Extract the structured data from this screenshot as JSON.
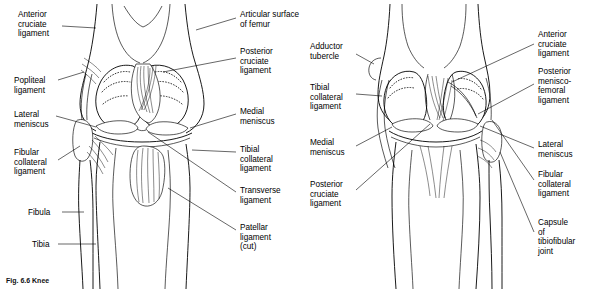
{
  "figure": {
    "caption": "Fig. 6.6  Knee",
    "views": [
      {
        "name": "anterior-view",
        "description": "Anterior view of right knee joint with patella removed"
      },
      {
        "name": "posterior-view",
        "description": "Posterior view of right knee joint"
      }
    ]
  },
  "labels": {
    "left_view": [
      {
        "id": "anterior-cruciate-ligament",
        "text": "Anterior\ncruciate\nligament",
        "x": 18,
        "y": 10,
        "align": "left"
      },
      {
        "id": "popliteal-ligament",
        "text": "Popliteal\nligament",
        "x": 14,
        "y": 76,
        "align": "left"
      },
      {
        "id": "lateral-meniscus",
        "text": "Lateral\nmeniscus",
        "x": 14,
        "y": 110,
        "align": "left"
      },
      {
        "id": "fibular-collateral-ligament",
        "text": "Fibular\ncollateral\nligament",
        "x": 14,
        "y": 148,
        "align": "left"
      },
      {
        "id": "fibula",
        "text": "Fibula",
        "x": 28,
        "y": 208,
        "align": "left"
      },
      {
        "id": "tibia",
        "text": "Tibia",
        "x": 32,
        "y": 240,
        "align": "left"
      },
      {
        "id": "articular-surface-of-femur",
        "text": "Articular surface\nof femur",
        "x": 240,
        "y": 10,
        "align": "left"
      },
      {
        "id": "posterior-cruciate-ligament",
        "text": "Posterior\ncruciate\nligament",
        "x": 240,
        "y": 47,
        "align": "left"
      },
      {
        "id": "medial-meniscus",
        "text": "Medial\nmeniscus",
        "x": 240,
        "y": 107,
        "align": "left"
      },
      {
        "id": "tibial-collateral-ligament",
        "text": "Tibial\ncollateral\nligament",
        "x": 240,
        "y": 145,
        "align": "left"
      },
      {
        "id": "transverse-ligament",
        "text": "Transverse\nligament",
        "x": 240,
        "y": 186,
        "align": "left"
      },
      {
        "id": "patellar-ligament-cut",
        "text": "Patellar\nligament\n(cut)",
        "x": 240,
        "y": 223,
        "align": "left"
      }
    ],
    "right_view": [
      {
        "id": "adductor-tubercle",
        "text": "Adductor\ntubercle",
        "x": 310,
        "y": 42,
        "align": "left"
      },
      {
        "id": "tibial-collateral-ligament-post",
        "text": "Tibial\ncollateral\nligament",
        "x": 310,
        "y": 83,
        "align": "left"
      },
      {
        "id": "medial-meniscus-post",
        "text": "Medial\nmeniscus",
        "x": 310,
        "y": 138,
        "align": "left"
      },
      {
        "id": "posterior-cruciate-ligament-post",
        "text": "Posterior\ncruciate\nligament",
        "x": 310,
        "y": 180,
        "align": "left"
      },
      {
        "id": "anterior-cruciate-ligament-post",
        "text": "Anterior\ncruciate\nligament",
        "x": 538,
        "y": 30,
        "align": "left"
      },
      {
        "id": "posterior-meniscofemoral-ligament",
        "text": "Posterior\nmenisco-\nfemoral\nligament",
        "x": 538,
        "y": 67,
        "align": "left"
      },
      {
        "id": "lateral-meniscus-post",
        "text": "Lateral\nmeniscus",
        "x": 538,
        "y": 140,
        "align": "left"
      },
      {
        "id": "fibular-collateral-ligament-post",
        "text": "Fibular\ncollateral\nligament",
        "x": 538,
        "y": 170,
        "align": "left"
      },
      {
        "id": "capsule-of-tibiofibular-joint",
        "text": "Capsule\nof\ntibiofibular\njoint",
        "x": 538,
        "y": 218,
        "align": "left"
      }
    ]
  },
  "colors": {
    "ink": "#000000",
    "background": "#ffffff",
    "shading": "#e8e8e8"
  }
}
